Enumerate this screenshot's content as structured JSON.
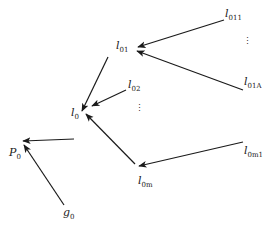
{
  "diagram": {
    "type": "tree",
    "direction": "leaves-to-root (arrows point toward root)",
    "colors": {
      "line": "#1a1a1a",
      "background": "#ffffff"
    },
    "nodes": [
      {
        "id": "P0",
        "base": "P",
        "sub": "0"
      },
      {
        "id": "l0",
        "base": "l",
        "sub": "0"
      },
      {
        "id": "g0",
        "base": "g",
        "sub": "0"
      },
      {
        "id": "l01",
        "base": "l",
        "sub": "01"
      },
      {
        "id": "l02",
        "base": "l",
        "sub": "02"
      },
      {
        "id": "l0m",
        "base": "l",
        "sub": "0m"
      },
      {
        "id": "l011",
        "base": "l",
        "sub": "011"
      },
      {
        "id": "l01A",
        "base": "l",
        "sub": "01A"
      },
      {
        "id": "l0m1",
        "base": "l",
        "sub": "0m1"
      }
    ],
    "edges": [
      {
        "from": "l0",
        "to": "P0"
      },
      {
        "from": "g0",
        "to": "P0"
      },
      {
        "from": "l01",
        "to": "l0"
      },
      {
        "from": "l02",
        "to": "l0"
      },
      {
        "from": "l0m",
        "to": "l0"
      },
      {
        "from": "l011",
        "to": "l01"
      },
      {
        "from": "l01A",
        "to": "l01"
      },
      {
        "from": "l0m1",
        "to": "l0m"
      }
    ],
    "ellipses": [
      {
        "between": [
          "l02",
          "l0m"
        ],
        "symbol": "⋮"
      },
      {
        "between": [
          "l011",
          "l01A"
        ],
        "symbol": "⋮"
      }
    ]
  }
}
